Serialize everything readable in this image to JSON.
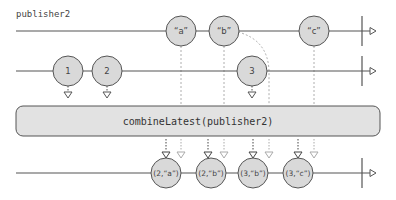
{
  "diagram": {
    "colors": {
      "line": "#555555",
      "marble_fill": "#d9d9d9",
      "marble_stroke": "#555555",
      "operator_fill": "#e2e2e2",
      "dashed_dark": "#444444",
      "dashed_light": "#aaaaaa"
    },
    "streams": [
      {
        "id": "publisher2",
        "label": "publisher2",
        "y": 31,
        "completes_at_x": 362,
        "marbles": [
          {
            "label": "“a”",
            "x": 181
          },
          {
            "label": "“b”",
            "x": 224
          },
          {
            "label": "“c”",
            "x": 314
          }
        ]
      },
      {
        "id": "source",
        "label": "",
        "y": 71,
        "completes_at_x": 362,
        "marbles": [
          {
            "label": "1",
            "x": 68
          },
          {
            "label": "2",
            "x": 107
          },
          {
            "label": "3",
            "x": 252
          }
        ]
      }
    ],
    "operator": {
      "label": "combineLatest(publisher2)"
    },
    "output": {
      "y": 173,
      "completes_at_x": 362,
      "marbles": [
        {
          "label": "(2,“a”)",
          "x": 166
        },
        {
          "label": "(2,“b”)",
          "x": 211
        },
        {
          "label": "(3,“b”)",
          "x": 253
        },
        {
          "label": "(3,“c”)",
          "x": 298
        }
      ]
    }
  }
}
